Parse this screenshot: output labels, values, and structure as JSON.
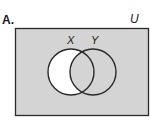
{
  "diagram": {
    "type": "venn",
    "option_label": "A.",
    "universe_label": "U",
    "sets": [
      {
        "name": "X",
        "label": "X"
      },
      {
        "name": "Y",
        "label": "Y"
      }
    ],
    "shaded_region": "complement of (X minus Y)",
    "unshaded_region": "X only (X minus Y)",
    "colors": {
      "shade": "#d4d4d4",
      "unshaded": "#ffffff",
      "outline": "#2a2a2a"
    }
  }
}
